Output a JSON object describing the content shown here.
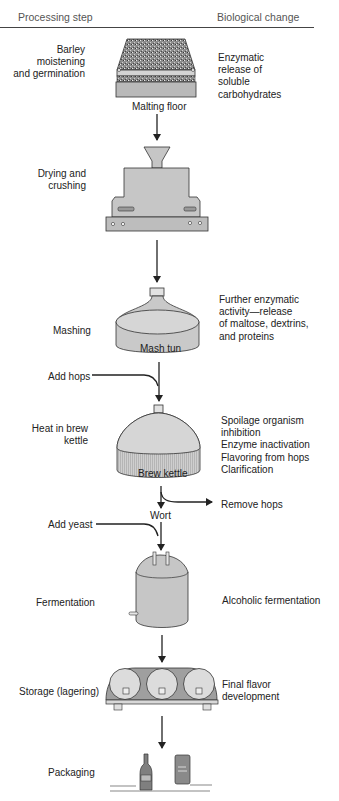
{
  "header": {
    "left": "Processing step",
    "right": "Biological change"
  },
  "steps": [
    {
      "step": "Barley moistening and germination",
      "step_lines": [
        "Barley moistening",
        "and germination"
      ],
      "equipment": "Malting floor",
      "change_lines": [
        "Enzymatic",
        "release of",
        "soluble",
        "carbohydrates"
      ]
    },
    {
      "step": "Drying and crushing",
      "step_lines": [
        "Drying and",
        "crushing"
      ],
      "equipment": "",
      "change_lines": []
    },
    {
      "step": "Mashing",
      "step_lines": [
        "Mashing"
      ],
      "equipment": "Mash tun",
      "change_lines": [
        "Further enzymatic",
        "activity—release",
        "of maltose, dextrins,",
        "and proteins"
      ]
    },
    {
      "step": "Heat in brew kettle",
      "step_lines": [
        "Heat in brew",
        "kettle"
      ],
      "equipment": "Brew kettle",
      "change_lines": [
        "Spoilage organism inhibition",
        "Enzyme inactivation",
        "Flavoring from hops",
        "Clarification"
      ]
    },
    {
      "step": "Fermentation",
      "step_lines": [
        "Fermentation"
      ],
      "equipment": "",
      "change_lines": [
        "Alcoholic fermentation"
      ]
    },
    {
      "step": "Storage (lagering)",
      "step_lines": [
        "Storage (lagering)"
      ],
      "equipment": "",
      "change_lines": [
        "Final flavor",
        "development"
      ]
    },
    {
      "step": "Packaging",
      "step_lines": [
        "Packaging"
      ],
      "equipment": "",
      "change_lines": []
    }
  ],
  "inputs": {
    "add_hops": "Add hops",
    "add_yeast": "Add yeast",
    "remove_hops": "Remove hops",
    "wort": "Wort"
  },
  "colors": {
    "equipment_fill": "#c8c8c8",
    "equipment_dark": "#9a9a9a",
    "stroke": "#222222"
  }
}
